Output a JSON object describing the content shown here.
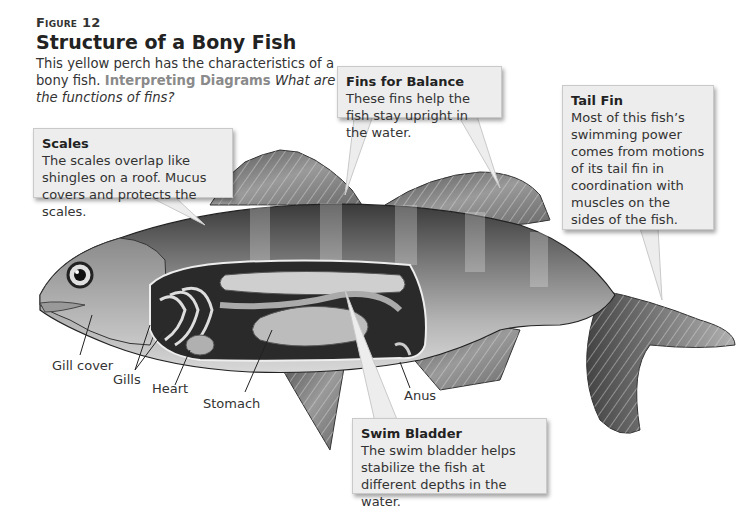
{
  "figure": {
    "label": "Figure 12",
    "title": "Structure of a Bony Fish",
    "caption": "This yellow perch has the characteristics of a bony fish.",
    "interpreting_label": "Interpreting Diagrams",
    "question": "What are the functions of fins?"
  },
  "callouts": {
    "scales": {
      "title": "Scales",
      "text": "The scales overlap like shingles on a roof. Mucus covers and protects the scales."
    },
    "fins_balance": {
      "title": "Fins for Balance",
      "text": "These fins help the fish stay upright in the water."
    },
    "tail_fin": {
      "title": "Tail Fin",
      "text": "Most of this fish’s swimming power comes from motions of its tail fin in coordination with muscles on the sides of the fish."
    },
    "swim_bladder": {
      "title": "Swim Bladder",
      "text": "The swim bladder helps stabilize the fish at different depths in the water."
    }
  },
  "labels": {
    "gill_cover": "Gill cover",
    "gills": "Gills",
    "heart": "Heart",
    "stomach": "Stomach",
    "anus": "Anus"
  },
  "colors": {
    "callout_bg": "#ededed",
    "interpreting": "#8a8a8a",
    "text": "#333333"
  }
}
